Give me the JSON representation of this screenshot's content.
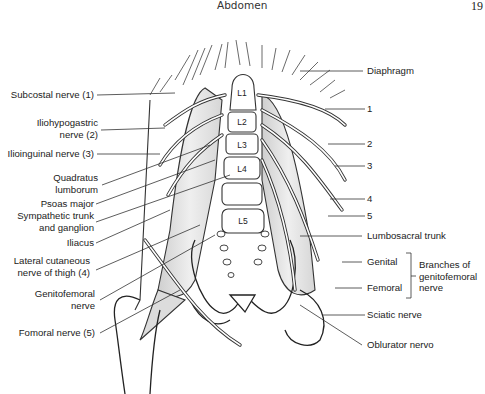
{
  "header": {
    "title": "Abdomen",
    "page_number": "19"
  },
  "figure": {
    "vertebrae": [
      "L1",
      "L2",
      "L3",
      "L4",
      "L5"
    ],
    "left_labels": [
      {
        "id": "subcostal",
        "lines": [
          "Subcostal nerve (1)"
        ]
      },
      {
        "id": "iliohypogastric",
        "lines": [
          "Iliohypogastric",
          "nerve (2)"
        ]
      },
      {
        "id": "ilioinguinal",
        "lines": [
          "Ilioinguinal nerve (3)"
        ]
      },
      {
        "id": "quadratus",
        "lines": [
          "Quadratus",
          "lumborum"
        ]
      },
      {
        "id": "psoas",
        "lines": [
          "Psoas major"
        ]
      },
      {
        "id": "sympathetic",
        "lines": [
          "Sympathetic trunk",
          "and ganglion"
        ]
      },
      {
        "id": "iliacus",
        "lines": [
          "Iliacus"
        ]
      },
      {
        "id": "lateral-cutaneous",
        "lines": [
          "Lateral cutaneous",
          "nerve of thigh (4)"
        ]
      },
      {
        "id": "genitofemoral",
        "lines": [
          "Genitofemoral",
          "nerve"
        ]
      },
      {
        "id": "femoral",
        "lines": [
          "Fomoral nerve (5)"
        ]
      }
    ],
    "right_labels": [
      {
        "id": "diaphragm",
        "text": "Diaphragm"
      },
      {
        "id": "n1",
        "text": "1"
      },
      {
        "id": "n2",
        "text": "2"
      },
      {
        "id": "n3",
        "text": "3"
      },
      {
        "id": "n4",
        "text": "4"
      },
      {
        "id": "n5",
        "text": "5"
      },
      {
        "id": "lumbosacral",
        "text": "Lumbosacral trunk"
      },
      {
        "id": "genital",
        "text": "Genital"
      },
      {
        "id": "femoral-branch",
        "text": "Femoral"
      },
      {
        "id": "sciatic",
        "text": "Sciatic nerve"
      },
      {
        "id": "obturator",
        "text": "Oblurator nervo"
      }
    ],
    "bracket_label": [
      "Branches of",
      "genitofemoral",
      "nerve"
    ]
  }
}
